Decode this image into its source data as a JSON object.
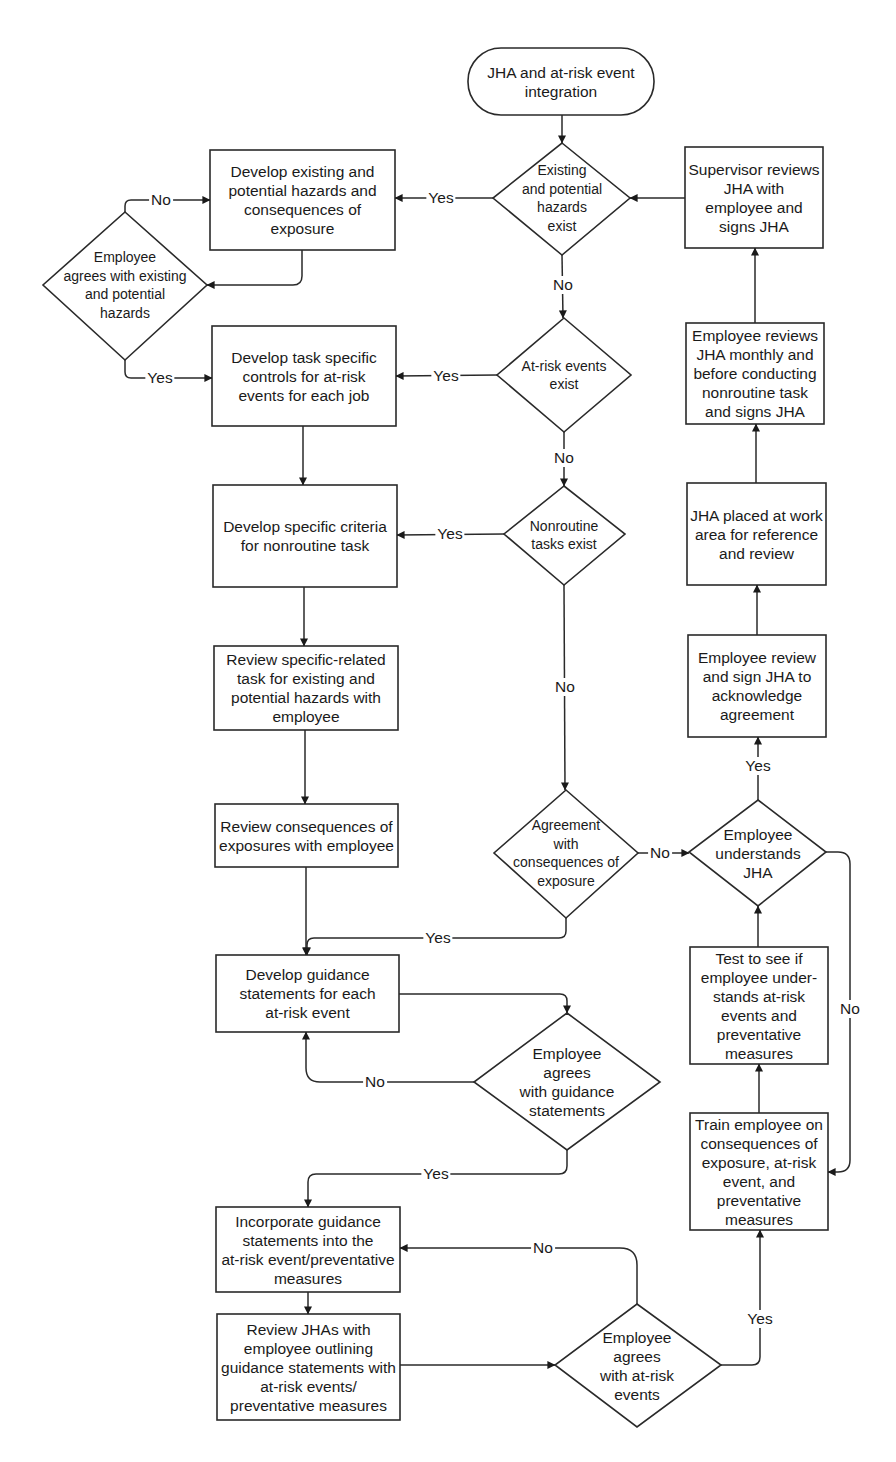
{
  "diagram": {
    "type": "flowchart",
    "title": "JHA and at-risk event integration",
    "colors": {
      "line": "#2a2a2a",
      "text": "#1a1a1a",
      "background": "#ffffff"
    },
    "nodes": {
      "start": {
        "shape": "terminator",
        "label": "JHA and at-risk event\nintegration"
      },
      "d_hazards_exist": {
        "shape": "decision",
        "label": "Existing\nand potential\nhazards\nexist"
      },
      "develop_hazards": {
        "shape": "process",
        "label": "Develop existing and\npotential hazards and\nconsequences of\nexposure"
      },
      "d_employee_agrees_hazards": {
        "shape": "decision",
        "label": "Employee\nagrees with existing\nand potential\nhazards"
      },
      "develop_controls": {
        "shape": "process",
        "label": "Develop task specific\ncontrols for at-risk\nevents for each job"
      },
      "d_atrisk_exist": {
        "shape": "decision",
        "label": "At-risk events\nexist"
      },
      "develop_criteria": {
        "shape": "process",
        "label": "Develop specific criteria\nfor nonroutine task"
      },
      "d_nonroutine_exist": {
        "shape": "decision",
        "label": "Nonroutine\ntasks exist"
      },
      "review_specific": {
        "shape": "process",
        "label": "Review specific-related\ntask for existing and\npotential hazards with\nemployee"
      },
      "review_consequences": {
        "shape": "process",
        "label": "Review consequences of\nexposures with employee"
      },
      "d_agreement_consequences": {
        "shape": "decision",
        "label": "Agreement\nwith\nconsequences of\nexposure"
      },
      "develop_guidance": {
        "shape": "process",
        "label": "Develop guidance\nstatements for each\nat-risk event"
      },
      "d_agrees_guidance": {
        "shape": "decision",
        "label": "Employee\nagrees\nwith guidance\nstatements"
      },
      "incorporate_guidance": {
        "shape": "process",
        "label": "Incorporate guidance\nstatements into the\nat-risk event/preventative\nmeasures"
      },
      "review_jhas": {
        "shape": "process",
        "label": "Review JHAs with\nemployee outlining\nguidance statements with\nat-risk events/\npreventative measures"
      },
      "d_agrees_atrisk": {
        "shape": "decision",
        "label": "Employee\nagrees\nwith at-risk\nevents"
      },
      "supervisor_reviews": {
        "shape": "process",
        "label": "Supervisor reviews\nJHA with\nemployee and\nsigns JHA"
      },
      "employee_reviews_monthly": {
        "shape": "process",
        "label": "Employee reviews\nJHA monthly and\nbefore conducting\nnonroutine task\nand signs JHA"
      },
      "jha_placed": {
        "shape": "process",
        "label": "JHA placed at work\narea for reference\nand review"
      },
      "employee_review_sign": {
        "shape": "process",
        "label": "Employee review\nand sign JHA to\nacknowledge\nagreement"
      },
      "d_understands_jha": {
        "shape": "decision",
        "label": "Employee\nunderstands\nJHA"
      },
      "test_employee": {
        "shape": "process",
        "label": "Test to see if\nemployee under-\nstands at-risk\nevents and\npreventative\nmeasures"
      },
      "train_employee": {
        "shape": "process",
        "label": "Train employee on\nconsequences of\nexposure, at-risk\nevent, and\npreventative\nmeasures"
      }
    },
    "edge_labels": {
      "hazards_yes": "Yes",
      "hazards_no": "No",
      "agrees_hazards_no": "No",
      "agrees_hazards_yes": "Yes",
      "atrisk_yes": "Yes",
      "atrisk_no": "No",
      "nonroutine_yes": "Yes",
      "nonroutine_no": "No",
      "consequences_yes": "Yes",
      "consequences_no": "No",
      "guidance_no": "No",
      "guidance_yes": "Yes",
      "atrisk_agree_no": "No",
      "atrisk_agree_yes": "Yes",
      "understands_yes": "Yes",
      "understands_no": "No"
    },
    "edges": [
      {
        "from": "start",
        "to": "d_hazards_exist"
      },
      {
        "from": "d_hazards_exist",
        "to": "develop_hazards",
        "label": "Yes"
      },
      {
        "from": "d_hazards_exist",
        "to": "d_atrisk_exist",
        "label": "No"
      },
      {
        "from": "develop_hazards",
        "to": "d_employee_agrees_hazards"
      },
      {
        "from": "d_employee_agrees_hazards",
        "to": "develop_hazards",
        "label": "No"
      },
      {
        "from": "d_employee_agrees_hazards",
        "to": "develop_controls",
        "label": "Yes"
      },
      {
        "from": "d_atrisk_exist",
        "to": "develop_controls",
        "label": "Yes"
      },
      {
        "from": "d_atrisk_exist",
        "to": "d_nonroutine_exist",
        "label": "No"
      },
      {
        "from": "develop_controls",
        "to": "develop_criteria"
      },
      {
        "from": "d_nonroutine_exist",
        "to": "develop_criteria",
        "label": "Yes"
      },
      {
        "from": "d_nonroutine_exist",
        "to": "d_agreement_consequences",
        "label": "No"
      },
      {
        "from": "develop_criteria",
        "to": "review_specific"
      },
      {
        "from": "review_specific",
        "to": "review_consequences"
      },
      {
        "from": "review_consequences",
        "to": "develop_guidance"
      },
      {
        "from": "d_agreement_consequences",
        "to": "develop_guidance",
        "label": "Yes"
      },
      {
        "from": "d_agreement_consequences",
        "to": "d_understands_jha",
        "label": "No"
      },
      {
        "from": "develop_guidance",
        "to": "d_agrees_guidance"
      },
      {
        "from": "d_agrees_guidance",
        "to": "develop_guidance",
        "label": "No"
      },
      {
        "from": "d_agrees_guidance",
        "to": "incorporate_guidance",
        "label": "Yes"
      },
      {
        "from": "incorporate_guidance",
        "to": "review_jhas"
      },
      {
        "from": "review_jhas",
        "to": "d_agrees_atrisk"
      },
      {
        "from": "d_agrees_atrisk",
        "to": "incorporate_guidance",
        "label": "No"
      },
      {
        "from": "d_agrees_atrisk",
        "to": "train_employee",
        "label": "Yes"
      },
      {
        "from": "train_employee",
        "to": "test_employee"
      },
      {
        "from": "test_employee",
        "to": "d_understands_jha"
      },
      {
        "from": "d_understands_jha",
        "to": "employee_review_sign",
        "label": "Yes"
      },
      {
        "from": "d_understands_jha",
        "to": "train_employee",
        "label": "No"
      },
      {
        "from": "employee_review_sign",
        "to": "jha_placed"
      },
      {
        "from": "jha_placed",
        "to": "employee_reviews_monthly"
      },
      {
        "from": "employee_reviews_monthly",
        "to": "supervisor_reviews"
      },
      {
        "from": "supervisor_reviews",
        "to": "d_hazards_exist"
      }
    ]
  }
}
